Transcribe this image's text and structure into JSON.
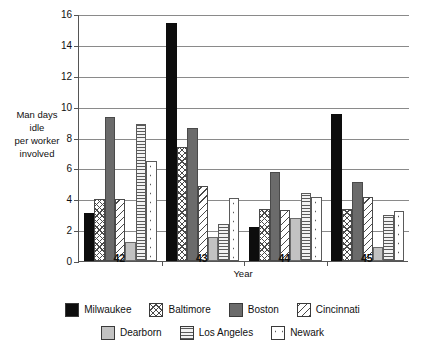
{
  "chart_data": {
    "type": "bar",
    "title": "",
    "xlabel": "Year",
    "ylabel": "Man days idle per worker involved",
    "ylabel_lines": [
      "Man days",
      "idle",
      "per worker",
      "involved"
    ],
    "categories": [
      "42",
      "43",
      "44",
      "45"
    ],
    "ylim": [
      0,
      16
    ],
    "yticks": [
      0,
      2,
      4,
      6,
      8,
      10,
      12,
      14,
      16
    ],
    "ytick_labels": [
      "0",
      "2",
      "4",
      "6",
      "8",
      "10",
      "12",
      "14",
      "16"
    ],
    "grid": true,
    "legend_position": "bottom",
    "series": [
      {
        "name": "Milwaukee",
        "pattern": "solid-black",
        "color": "#0d0d0d",
        "values": [
          3.1,
          15.4,
          2.2,
          9.5
        ]
      },
      {
        "name": "Baltimore",
        "pattern": "crosshatch",
        "color": "#ffffff",
        "values": [
          4.0,
          7.4,
          3.4,
          3.4
        ]
      },
      {
        "name": "Boston",
        "pattern": "solid-gray",
        "color": "#6b6b6b",
        "values": [
          9.35,
          8.6,
          5.75,
          5.15
        ]
      },
      {
        "name": "Cincinnati",
        "pattern": "diagonal",
        "color": "#ffffff",
        "values": [
          4.0,
          4.85,
          3.3,
          4.15
        ]
      },
      {
        "name": "Dearborn",
        "pattern": "light-gray",
        "color": "#c2c2c2",
        "values": [
          1.25,
          1.55,
          2.8,
          0.9
        ]
      },
      {
        "name": "Los Angeles",
        "pattern": "horizontal",
        "color": "#f2f2f2",
        "values": [
          8.9,
          2.4,
          4.4,
          3.0
        ]
      },
      {
        "name": "Newark",
        "pattern": "dots",
        "color": "#ffffff",
        "values": [
          6.5,
          4.05,
          4.15,
          3.25
        ]
      }
    ]
  }
}
